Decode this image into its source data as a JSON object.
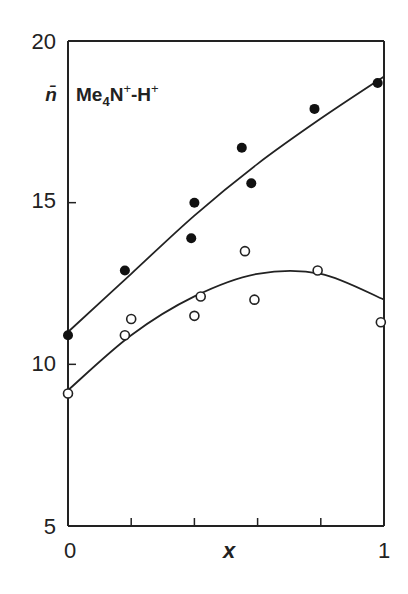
{
  "chart_data": {
    "type": "scatter",
    "title": "",
    "annotation": "Me4N+-H+",
    "ylabel": "n̄",
    "xlabel": "x",
    "xlim": [
      0,
      1
    ],
    "ylim": [
      5,
      20
    ],
    "x_tick_labels": [
      "0",
      "1"
    ],
    "x_minor_ticks": [
      0.2,
      0.4,
      0.6,
      0.8
    ],
    "y_tick_labels": [
      "5",
      "10",
      "15",
      "20"
    ],
    "grid": false,
    "legend_position": "none",
    "series": [
      {
        "name": "filled circles",
        "marker": "filled-circle",
        "x": [
          0.0,
          0.18,
          0.39,
          0.4,
          0.55,
          0.58,
          0.78,
          0.98
        ],
        "y": [
          10.9,
          12.9,
          13.9,
          15.0,
          16.7,
          15.6,
          17.9,
          18.7
        ],
        "fit_curve": {
          "x": [
            0,
            0.2,
            0.4,
            0.6,
            0.8,
            1.0
          ],
          "y": [
            11.0,
            12.8,
            14.6,
            16.2,
            17.6,
            18.9
          ]
        }
      },
      {
        "name": "open circles",
        "marker": "open-circle",
        "x": [
          0.0,
          0.18,
          0.2,
          0.4,
          0.42,
          0.56,
          0.59,
          0.79,
          0.99
        ],
        "y": [
          9.1,
          10.9,
          11.4,
          11.5,
          12.1,
          13.5,
          12.0,
          12.9,
          11.3
        ],
        "fit_curve": {
          "x": [
            0,
            0.2,
            0.4,
            0.6,
            0.8,
            1.0
          ],
          "y": [
            9.2,
            10.9,
            12.1,
            12.8,
            12.8,
            12.0
          ]
        }
      }
    ]
  },
  "labels": {
    "y_axis_symbol": "n̄",
    "annotation_main": "Me",
    "annotation_sub": "4",
    "annotation_n": "N",
    "annotation_sup1": "+",
    "annotation_dash": "-H",
    "annotation_sup2": "+",
    "x_axis_label": "x",
    "x_tick_0": "0",
    "x_tick_1": "1",
    "y_tick_5": "5",
    "y_tick_10": "10",
    "y_tick_15": "15",
    "y_tick_20": "20"
  }
}
